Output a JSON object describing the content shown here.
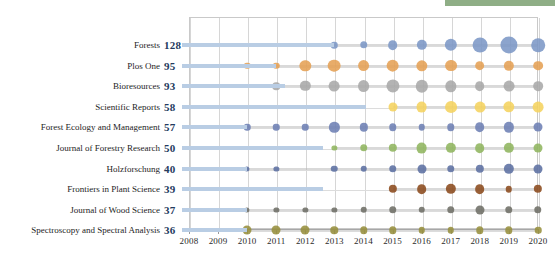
{
  "decor": {
    "top_bar_color": "#8fae86"
  },
  "chart_data": {
    "type": "scatter",
    "title": "",
    "xlabel": "",
    "ylabel": "",
    "grid": true,
    "legend": "none",
    "xlim": [
      2008,
      2020
    ],
    "x_ticks": [
      2008,
      2009,
      2010,
      2011,
      2012,
      2013,
      2014,
      2015,
      2016,
      2017,
      2018,
      2019,
      2020
    ],
    "categories": [
      "Forests",
      "Plos One",
      "Bioresources",
      "Scientific Reports",
      "Forest Ecology and Management",
      "Journal of Forestry Research",
      "Holzforschung",
      "Frontiers in Plant Science",
      "Journal of Wood Science",
      "Spectroscopy and Spectral Analysis"
    ],
    "totals": [
      128,
      95,
      93,
      58,
      57,
      50,
      40,
      39,
      37,
      36
    ],
    "series": [
      {
        "name": "Forests",
        "color": "#7c97c6",
        "points": [
          {
            "x": 2013,
            "v": 2
          },
          {
            "x": 2014,
            "v": 3
          },
          {
            "x": 2015,
            "v": 6
          },
          {
            "x": 2016,
            "v": 7
          },
          {
            "x": 2017,
            "v": 11
          },
          {
            "x": 2018,
            "v": 17
          },
          {
            "x": 2019,
            "v": 24
          },
          {
            "x": 2020,
            "v": 14
          }
        ]
      },
      {
        "name": "Plos One",
        "color": "#e5a054",
        "points": [
          {
            "x": 2010,
            "v": 2
          },
          {
            "x": 2011,
            "v": 2
          },
          {
            "x": 2012,
            "v": 9
          },
          {
            "x": 2013,
            "v": 12
          },
          {
            "x": 2014,
            "v": 10
          },
          {
            "x": 2015,
            "v": 12
          },
          {
            "x": 2016,
            "v": 9
          },
          {
            "x": 2017,
            "v": 10
          },
          {
            "x": 2018,
            "v": 6
          },
          {
            "x": 2019,
            "v": 7
          },
          {
            "x": 2020,
            "v": 6
          }
        ]
      },
      {
        "name": "Bioresources",
        "color": "#a9a9a9",
        "points": [
          {
            "x": 2011,
            "v": 3
          },
          {
            "x": 2012,
            "v": 7
          },
          {
            "x": 2013,
            "v": 8
          },
          {
            "x": 2014,
            "v": 10
          },
          {
            "x": 2015,
            "v": 13
          },
          {
            "x": 2016,
            "v": 11
          },
          {
            "x": 2017,
            "v": 9
          },
          {
            "x": 2018,
            "v": 6
          },
          {
            "x": 2019,
            "v": 8
          },
          {
            "x": 2020,
            "v": 6
          }
        ]
      },
      {
        "name": "Scientific Reports",
        "color": "#f5d35f",
        "points": [
          {
            "x": 2015,
            "v": 5
          },
          {
            "x": 2016,
            "v": 8
          },
          {
            "x": 2017,
            "v": 10
          },
          {
            "x": 2018,
            "v": 8
          },
          {
            "x": 2019,
            "v": 9
          },
          {
            "x": 2020,
            "v": 8
          }
        ]
      },
      {
        "name": "Forest Ecology and Management",
        "color": "#6d80b4",
        "points": [
          {
            "x": 2010,
            "v": 2
          },
          {
            "x": 2011,
            "v": 2
          },
          {
            "x": 2012,
            "v": 2
          },
          {
            "x": 2013,
            "v": 7
          },
          {
            "x": 2014,
            "v": 4
          },
          {
            "x": 2015,
            "v": 3
          },
          {
            "x": 2016,
            "v": 2
          },
          {
            "x": 2017,
            "v": 3
          },
          {
            "x": 2018,
            "v": 6
          },
          {
            "x": 2019,
            "v": 7
          },
          {
            "x": 2020,
            "v": 5
          }
        ]
      },
      {
        "name": "Journal of Forestry Research",
        "color": "#90b55e",
        "points": [
          {
            "x": 2013,
            "v": 1
          },
          {
            "x": 2014,
            "v": 3
          },
          {
            "x": 2015,
            "v": 4
          },
          {
            "x": 2016,
            "v": 8
          },
          {
            "x": 2017,
            "v": 7
          },
          {
            "x": 2018,
            "v": 6
          },
          {
            "x": 2019,
            "v": 7
          },
          {
            "x": 2020,
            "v": 5
          }
        ]
      },
      {
        "name": "Holzforschung",
        "color": "#5c6fa2",
        "points": [
          {
            "x": 2010,
            "v": 1
          },
          {
            "x": 2011,
            "v": 1
          },
          {
            "x": 2013,
            "v": 2
          },
          {
            "x": 2014,
            "v": 2
          },
          {
            "x": 2015,
            "v": 3
          },
          {
            "x": 2016,
            "v": 5
          },
          {
            "x": 2017,
            "v": 3
          },
          {
            "x": 2018,
            "v": 4
          },
          {
            "x": 2019,
            "v": 7
          },
          {
            "x": 2020,
            "v": 5
          }
        ]
      },
      {
        "name": "Frontiers in Plant Science",
        "color": "#8b4a1d",
        "points": [
          {
            "x": 2015,
            "v": 4
          },
          {
            "x": 2016,
            "v": 6
          },
          {
            "x": 2017,
            "v": 7
          },
          {
            "x": 2018,
            "v": 6
          },
          {
            "x": 2019,
            "v": 2
          },
          {
            "x": 2020,
            "v": 4
          }
        ]
      },
      {
        "name": "Journal of Wood Science",
        "color": "#6e6e66",
        "points": [
          {
            "x": 2010,
            "v": 1
          },
          {
            "x": 2011,
            "v": 1
          },
          {
            "x": 2012,
            "v": 1
          },
          {
            "x": 2013,
            "v": 1
          },
          {
            "x": 2014,
            "v": 2
          },
          {
            "x": 2015,
            "v": 3
          },
          {
            "x": 2016,
            "v": 2
          },
          {
            "x": 2017,
            "v": 3
          },
          {
            "x": 2018,
            "v": 5
          },
          {
            "x": 2019,
            "v": 3
          },
          {
            "x": 2020,
            "v": 3
          }
        ]
      },
      {
        "name": "Spectroscopy and Spectral Analysis",
        "color": "#97903e",
        "points": [
          {
            "x": 2010,
            "v": 5
          },
          {
            "x": 2011,
            "v": 5
          },
          {
            "x": 2012,
            "v": 5
          },
          {
            "x": 2013,
            "v": 3
          },
          {
            "x": 2014,
            "v": 3
          },
          {
            "x": 2015,
            "v": 3
          },
          {
            "x": 2016,
            "v": 2
          },
          {
            "x": 2017,
            "v": 2
          },
          {
            "x": 2018,
            "v": 3
          },
          {
            "x": 2019,
            "v": 3
          },
          {
            "x": 2020,
            "v": 2
          }
        ]
      }
    ],
    "lead_bar_end_year": [
      2013,
      2011,
      2011.3,
      2014.1,
      2010,
      2012.6,
      2010,
      2012.6,
      2010,
      2010
    ]
  }
}
